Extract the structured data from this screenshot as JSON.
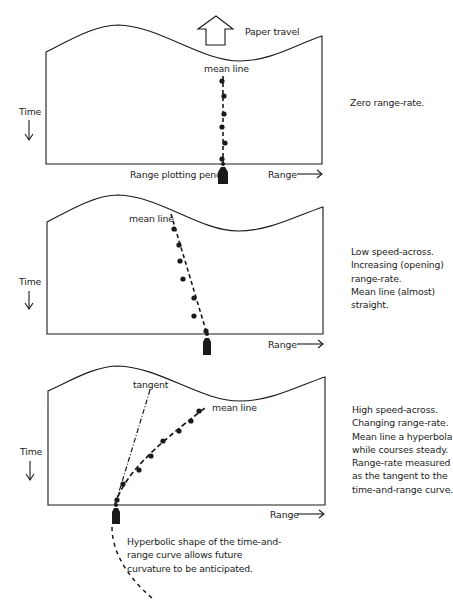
{
  "colors": {
    "ink": "#1a1a1a",
    "background": "#ffffff"
  },
  "panels": [
    {
      "id": "zero-range-rate",
      "paper_travel_label": "Paper travel",
      "time_label": "Time",
      "range_label": "Range",
      "mean_line_label": "mean line",
      "pencil_label": "Range plotting pencil",
      "description": [
        "Zero range-rate."
      ],
      "plot_points": [
        [
          222,
          81
        ],
        [
          224,
          96
        ],
        [
          224,
          114
        ],
        [
          222,
          127
        ],
        [
          225,
          143
        ],
        [
          222,
          159
        ]
      ]
    },
    {
      "id": "low-speed-across",
      "time_label": "Time",
      "range_label": "Range",
      "mean_line_label": "mean line",
      "description": [
        "Low speed-across.",
        "Increasing (opening)",
        "range-rate.",
        "Mean line (almost)",
        "straight."
      ],
      "plot_points": [
        [
          174,
          229
        ],
        [
          179,
          245
        ],
        [
          180,
          261
        ],
        [
          183,
          279
        ],
        [
          194,
          298
        ],
        [
          194,
          316
        ],
        [
          206,
          331
        ]
      ]
    },
    {
      "id": "high-speed-across",
      "time_label": "Time",
      "range_label": "Range",
      "mean_line_label": "mean line",
      "tangent_label": "tangent",
      "description": [
        "High speed-across.",
        "Changing range-rate.",
        "Mean line a hyperbola",
        "while courses steady.",
        "Range-rate measured",
        "as the tangent to the",
        "time-and-range curve."
      ],
      "caption": [
        "Hyperbolic shape of the time-and-",
        "range curve allows future",
        "curvature to be anticipated."
      ],
      "plot_points": [
        [
          117,
          500
        ],
        [
          123,
          484
        ],
        [
          139,
          470
        ],
        [
          151,
          456
        ],
        [
          163,
          441
        ],
        [
          179,
          431
        ],
        [
          191,
          421
        ],
        [
          199,
          411
        ]
      ]
    }
  ]
}
